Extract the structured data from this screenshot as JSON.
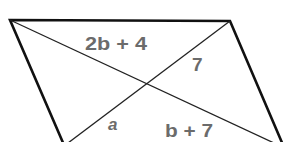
{
  "diagram": {
    "shape": "parallelogram",
    "vertices": {
      "top_left": [
        10,
        20
      ],
      "top_right": [
        230,
        21
      ],
      "bottom_right": [
        281,
        142
      ],
      "bottom_left": [
        62,
        142
      ]
    },
    "diagonals": [
      {
        "from": [
          10,
          20
        ],
        "to": [
          272,
          142
        ]
      },
      {
        "from": [
          230,
          21
        ],
        "to": [
          68,
          142
        ]
      }
    ],
    "labels": {
      "top_segment": "2b + 4",
      "right_segment": "7",
      "left_lower_segment": "a",
      "bottom_segment": "b + 7"
    },
    "colors": {
      "outline": "#111111",
      "diagonal": "#222222",
      "label": "#6b6b6b"
    }
  }
}
